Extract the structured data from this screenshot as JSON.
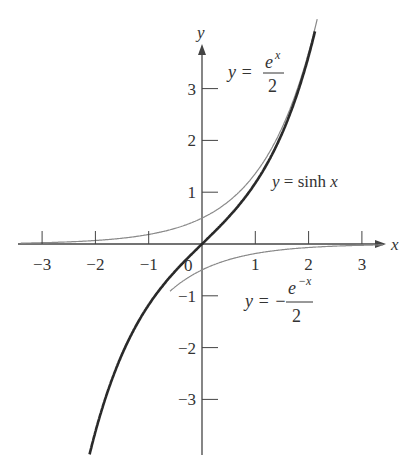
{
  "chart_data": {
    "type": "line",
    "title": "",
    "xlabel": "x",
    "ylabel": "y",
    "xlim": [
      -3.4,
      3.5
    ],
    "ylim": [
      -4.0,
      4.4
    ],
    "grid": false,
    "x_ticks": [
      -3,
      -2,
      -1,
      1,
      2,
      3
    ],
    "x_tick_labels": [
      "−3",
      "−2",
      "−1",
      "1",
      "2",
      "3"
    ],
    "y_ticks": [
      -3,
      -2,
      -1,
      1,
      2,
      3
    ],
    "y_tick_labels": [
      "−3",
      "−2",
      "−1",
      "1",
      "2",
      "3"
    ],
    "origin_label": "0",
    "series": [
      {
        "name": "y = e^x / 2",
        "style": "thin gray",
        "x": [
          -3.4,
          -3,
          -2,
          -1,
          0,
          1,
          2,
          3
        ],
        "y": [
          0.017,
          0.025,
          0.068,
          0.184,
          0.5,
          1.359,
          3.695,
          10.04
        ]
      },
      {
        "name": "y = sinh x",
        "style": "thick dark",
        "x": [
          -2.1,
          -2,
          -1,
          0,
          1,
          2,
          2.1
        ],
        "y": [
          -4.02,
          -3.627,
          -1.175,
          0,
          1.175,
          3.627,
          4.02
        ]
      },
      {
        "name": "y = −e^(−x) / 2",
        "style": "thin gray",
        "x": [
          -3,
          -2,
          -1,
          0,
          1,
          2,
          3,
          3.5
        ],
        "y": [
          -10.04,
          -3.695,
          -1.359,
          -0.5,
          -0.184,
          -0.068,
          -0.025,
          -0.015
        ]
      }
    ],
    "annotations": [
      {
        "text": "y = e^x / 2",
        "near": [
          0.5,
          3.6
        ]
      },
      {
        "text": "y = sinh x",
        "near": [
          1.3,
          1.2
        ]
      },
      {
        "text": "y = −e^(−x) / 2",
        "near": [
          0.8,
          -1.2
        ]
      }
    ]
  },
  "labels": {
    "x_axis": "x",
    "y_axis": "y",
    "origin": "0",
    "ex_lhs": "y =",
    "ex_num": "e",
    "ex_sup": "x",
    "ex_den": "2",
    "sinh": "y = sinh x",
    "emx_lhs": "y = −",
    "emx_num": "e",
    "emx_sup": "−x",
    "emx_den": "2"
  },
  "colors": {
    "axis": "#444444",
    "thin_curve": "#8a8a8a",
    "sinh_curve": "#2a2a2a"
  }
}
